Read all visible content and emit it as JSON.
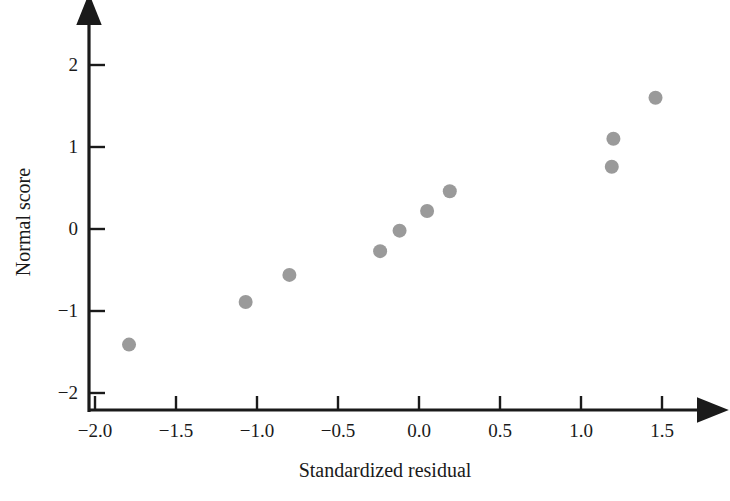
{
  "chart_data": {
    "type": "scatter",
    "title": "",
    "xlabel": "Standardized residual",
    "ylabel": "Normal score",
    "xlim": [
      -2.15,
      1.72
    ],
    "ylim": [
      -2.25,
      2.3
    ],
    "xticks": [
      -2.0,
      -1.5,
      -1.0,
      -0.5,
      0.0,
      0.5,
      1.0,
      1.5
    ],
    "xtick_labels": [
      "−2.0",
      "−1.5",
      "−1.0",
      "−0.5",
      "0.0",
      "0.5",
      "1.0",
      "1.5"
    ],
    "yticks": [
      -2,
      -1,
      0,
      1,
      2
    ],
    "ytick_labels": [
      "−2",
      "−1",
      "0",
      "1",
      "2"
    ],
    "grid": false,
    "legend": null,
    "marker_color": "#9a9a9a",
    "axis_color": "#1a1a1a",
    "points": [
      {
        "x": -1.79,
        "y": -1.41
      },
      {
        "x": -1.07,
        "y": -0.89
      },
      {
        "x": -0.8,
        "y": -0.56
      },
      {
        "x": -0.24,
        "y": -0.27
      },
      {
        "x": -0.12,
        "y": -0.02
      },
      {
        "x": 0.05,
        "y": 0.22
      },
      {
        "x": 0.19,
        "y": 0.46
      },
      {
        "x": 1.19,
        "y": 0.76
      },
      {
        "x": 1.2,
        "y": 1.1
      },
      {
        "x": 1.46,
        "y": 1.6
      }
    ]
  }
}
